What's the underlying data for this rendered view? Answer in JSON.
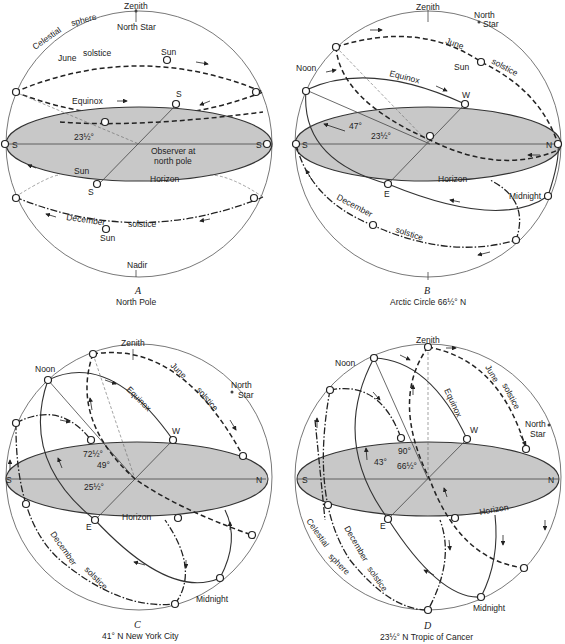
{
  "panels": [
    {
      "id": "A",
      "caption_letter": "A",
      "caption": "North Pole",
      "labels": {
        "celestial": "Celestial",
        "sphere": "sphere",
        "zenith": "Zenith",
        "north_star": "North Star",
        "june": "June",
        "solstice_june": "solstice",
        "sun_top": "Sun",
        "equinox": "Equinox",
        "angle": "23½°",
        "s_left": "S",
        "s_right": "S",
        "s_top": "S",
        "s_bottom": "S",
        "observer": "Observer at",
        "observer2": "north pole",
        "sun_eq": "Sun",
        "horizon": "Horizon",
        "december": "December",
        "solstice_dec": "solstice",
        "sun_dec": "Sun",
        "nadir": "Nadir"
      }
    },
    {
      "id": "B",
      "caption_letter": "B",
      "caption": "Arctic Circle 66½° N",
      "labels": {
        "zenith": "Zenith",
        "north": "North",
        "star": "Star",
        "june": "June",
        "solstice_june": "solstice",
        "sun": "Sun",
        "noon": "Noon",
        "equinox": "Equinox",
        "w": "W",
        "angle47": "47°",
        "angle23": "23½°",
        "s": "S",
        "n": "N",
        "e": "E",
        "horizon": "Horizon",
        "midnight": "Midnight",
        "december": "December",
        "solstice_dec": "solstice"
      }
    },
    {
      "id": "C",
      "caption_letter": "C",
      "caption": "41° N  New York City",
      "labels": {
        "zenith": "Zenith",
        "noon": "Noon",
        "june": "June",
        "solstice_june": "solstice",
        "north": "North",
        "star": "Star",
        "equinox": "Equinox",
        "w": "W",
        "angle72": "72½°",
        "angle49": "49°",
        "angle25": "25½°",
        "s": "S",
        "n": "N",
        "e": "E",
        "horizon": "Horizon",
        "december": "December",
        "solstice_dec": "solstice",
        "midnight": "Midnight"
      }
    },
    {
      "id": "D",
      "caption_letter": "D",
      "caption": "23½° N  Tropic of Cancer",
      "labels": {
        "zenith": "Zenith",
        "noon": "Noon",
        "june": "June",
        "solstice_june": "solstice",
        "equinox": "Equinox",
        "north": "North",
        "star": "Star",
        "w": "W",
        "angle90": "90°",
        "angle43": "43°",
        "angle66": "66½°",
        "s": "S",
        "n": "N",
        "e": "E",
        "horizon": "Horizon",
        "celestial": "Celestial",
        "sphere": "sphere",
        "december": "December",
        "solstice_dec": "solstice",
        "midnight": "Midnight"
      }
    }
  ]
}
